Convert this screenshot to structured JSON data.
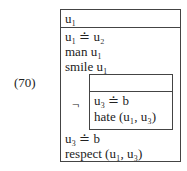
{
  "example_number": "(70)",
  "drs": {
    "universe": "u₁",
    "conditions": [
      "u₁ ≐ u₂",
      "man u₁",
      "smile u₁"
    ],
    "negation_symbol": "¬",
    "sub_drs": {
      "universe": "",
      "conditions": [
        "u₃ ≐ b",
        "hate (u₁, u₃)"
      ]
    },
    "after_conditions": [
      "u₃ ≐ b",
      "respect (u₁, u₃)"
    ]
  }
}
